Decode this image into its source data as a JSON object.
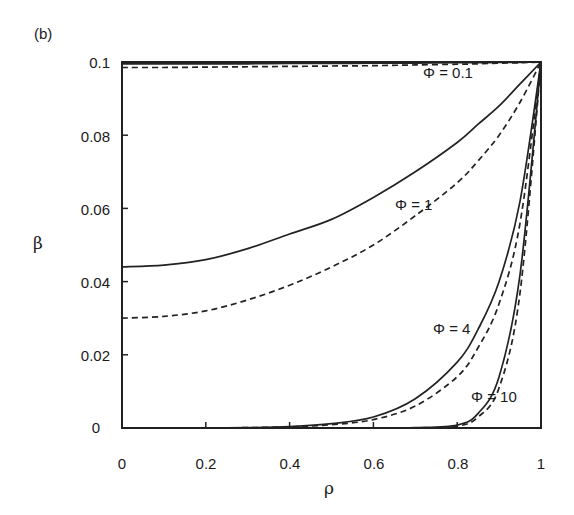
{
  "figure": {
    "panel_label": "(b)",
    "xlabel": "ρ",
    "ylabel": "β",
    "xticks": [
      "0",
      "0.2",
      "0.4",
      "0.6",
      "0.8",
      "1"
    ],
    "yticks": [
      "0",
      "0.02",
      "0.04",
      "0.06",
      "0.08",
      "0.1"
    ],
    "annotations": [
      "Φ = 0.1",
      "Φ = 1",
      "Φ = 4",
      "Φ = 10"
    ]
  },
  "chart_data": {
    "type": "line",
    "title": "",
    "panel_label": "(b)",
    "xlabel": "ρ",
    "ylabel": "β",
    "xlim": [
      0,
      1
    ],
    "ylim": [
      0,
      0.1
    ],
    "grid": false,
    "legend": "inline annotations",
    "x": [
      0,
      0.1,
      0.2,
      0.3,
      0.4,
      0.5,
      0.6,
      0.7,
      0.8,
      0.85,
      0.9,
      0.95,
      1.0
    ],
    "series": [
      {
        "name": "Φ = 0.1 (solid)",
        "style": "solid",
        "values": [
          0.0995,
          0.0995,
          0.0995,
          0.0995,
          0.0996,
          0.0996,
          0.0997,
          0.0997,
          0.0998,
          0.0998,
          0.0999,
          0.0999,
          0.1
        ]
      },
      {
        "name": "Φ = 0.1 (dashed)",
        "style": "dashed",
        "values": [
          0.0985,
          0.0985,
          0.0986,
          0.0987,
          0.0988,
          0.0989,
          0.099,
          0.0992,
          0.0994,
          0.0995,
          0.0997,
          0.0998,
          0.1
        ]
      },
      {
        "name": "Φ = 1 (solid)",
        "style": "solid",
        "values": [
          0.044,
          0.0445,
          0.046,
          0.049,
          0.053,
          0.057,
          0.063,
          0.07,
          0.078,
          0.083,
          0.088,
          0.094,
          0.1
        ]
      },
      {
        "name": "Φ = 1 (dashed)",
        "style": "dashed",
        "values": [
          0.03,
          0.0305,
          0.032,
          0.035,
          0.039,
          0.044,
          0.05,
          0.058,
          0.067,
          0.073,
          0.08,
          0.089,
          0.1
        ]
      },
      {
        "name": "Φ = 4 (solid)",
        "style": "solid",
        "values": [
          0.0,
          0.0,
          0.0,
          0.0001,
          0.0004,
          0.0012,
          0.003,
          0.008,
          0.018,
          0.027,
          0.04,
          0.062,
          0.1
        ]
      },
      {
        "name": "Φ = 4 (dashed)",
        "style": "dashed",
        "values": [
          0.0,
          0.0,
          0.0,
          0.0001,
          0.0003,
          0.0009,
          0.0023,
          0.006,
          0.014,
          0.022,
          0.034,
          0.056,
          0.1
        ]
      },
      {
        "name": "Φ = 10 (solid)",
        "style": "solid",
        "values": [
          0.0,
          0.0,
          0.0,
          0.0,
          0.0,
          0.0,
          0.0,
          0.0001,
          0.0008,
          0.004,
          0.014,
          0.042,
          0.1
        ]
      },
      {
        "name": "Φ = 10 (dashed)",
        "style": "dashed",
        "values": [
          0.0,
          0.0,
          0.0,
          0.0,
          0.0,
          0.0,
          0.0,
          0.0,
          0.0005,
          0.003,
          0.011,
          0.037,
          0.1
        ]
      }
    ]
  }
}
